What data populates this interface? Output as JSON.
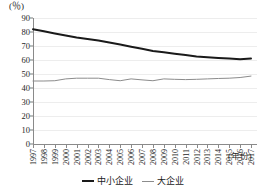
{
  "chart_data": {
    "type": "line",
    "title": "",
    "subtitle": "",
    "unit_label": "(％)",
    "xlabel": "(年份)",
    "ylabel": "",
    "ylim": [
      0,
      90
    ],
    "ytick_step": 10,
    "yticks": [
      0,
      10,
      20,
      30,
      40,
      50,
      60,
      70,
      80,
      90
    ],
    "grid": true,
    "grid_axis": "y",
    "legend_position": "bottom-center",
    "categories": [
      "1997",
      "1998",
      "1999",
      "2000",
      "2001",
      "2002",
      "2003",
      "2004",
      "2005",
      "2006",
      "2007",
      "2008",
      "2009",
      "2010",
      "2011",
      "2012",
      "2013",
      "2014",
      "2015",
      "2016",
      "2017"
    ],
    "series": [
      {
        "name": "中小企业",
        "color": "#1a1a1a",
        "width": 2,
        "values": [
          82.0,
          80.5,
          79.0,
          77.5,
          76.0,
          75.0,
          74.0,
          72.5,
          71.0,
          69.5,
          68.0,
          66.5,
          65.5,
          64.5,
          63.5,
          62.5,
          62.0,
          61.5,
          61.0,
          60.5,
          61.0
        ]
      },
      {
        "name": "大企业",
        "color": "#8c8c8c",
        "width": 1,
        "values": [
          45.0,
          45.0,
          45.2,
          46.5,
          47.0,
          47.0,
          47.0,
          46.0,
          45.2,
          46.5,
          45.8,
          45.2,
          46.5,
          46.2,
          46.0,
          46.2,
          46.5,
          46.8,
          47.0,
          47.5,
          48.5
        ]
      }
    ]
  },
  "legend": {
    "items": [
      {
        "label": "中小企业"
      },
      {
        "label": "大企业"
      }
    ]
  }
}
